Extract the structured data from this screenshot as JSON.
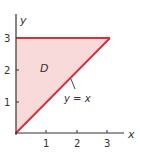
{
  "diagram": {
    "type": "region-plot",
    "axes": {
      "x_label": "x",
      "y_label": "y",
      "x_ticks": [
        "1",
        "2",
        "3"
      ],
      "y_ticks": [
        "1",
        "2",
        "3"
      ]
    },
    "region": {
      "name": "D",
      "vertices": [
        [
          0,
          0
        ],
        [
          3,
          3
        ],
        [
          0,
          3
        ]
      ],
      "fill_color": "#f7d6d6",
      "edge_color": "#d9303a"
    },
    "curve_label": "y = x",
    "colors": {
      "axis": "#333333",
      "edge": "#d9303a",
      "fill": "#f7d6d6"
    }
  }
}
